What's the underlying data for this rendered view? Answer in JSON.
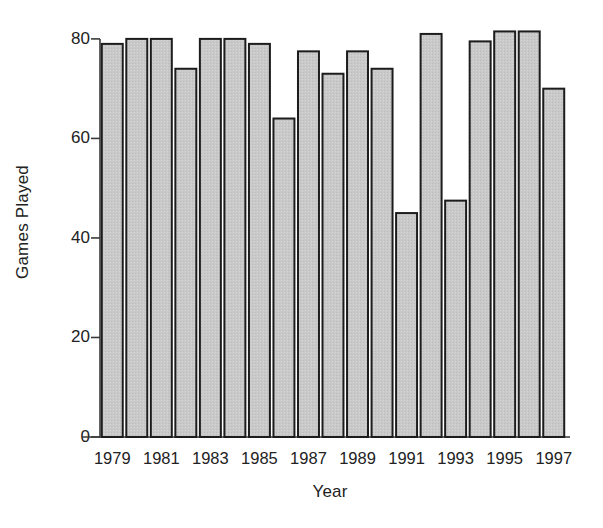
{
  "chart_data": {
    "type": "bar",
    "title": "",
    "subtitle": "",
    "xlabel": "Year",
    "ylabel": "Games Played",
    "categories": [
      1979,
      1980,
      1981,
      1982,
      1983,
      1984,
      1985,
      1986,
      1987,
      1988,
      1989,
      1990,
      1991,
      1992,
      1993,
      1994,
      1995,
      1996,
      1997
    ],
    "values": [
      79,
      80,
      80,
      74,
      80,
      80,
      79,
      64,
      77.5,
      73,
      77.5,
      74,
      45,
      81,
      47.5,
      79.5,
      81.5,
      81.5,
      70
    ],
    "ylim": [
      0,
      84
    ],
    "xlim": [
      1978.3,
      1997.7
    ],
    "yticks": [
      0,
      20,
      40,
      60,
      80
    ],
    "ytick_labels": [
      "0",
      "20",
      "40",
      "60",
      "80"
    ],
    "xticks": [
      1979,
      1981,
      1983,
      1985,
      1987,
      1989,
      1991,
      1993,
      1995,
      1997
    ],
    "xtick_labels": [
      "1979",
      "1981",
      "1983",
      "1985",
      "1987",
      "1989",
      "1991",
      "1993",
      "1995",
      "1997"
    ],
    "grid": false,
    "legend": false,
    "legend_position": "none",
    "bar_fill_color": "#c9c9c9",
    "bar_edge_color": "#1c1c1c",
    "axis_color": "#3a3a3a",
    "background_color": "#ffffff"
  }
}
